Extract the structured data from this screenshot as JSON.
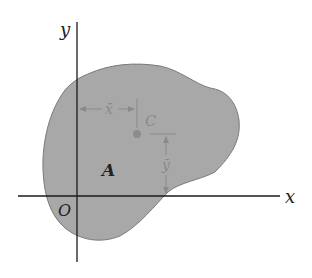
{
  "diagram": {
    "axes": {
      "x_label": "x",
      "y_label": "y",
      "origin_label": "O"
    },
    "region_label": "A",
    "centroid_label": "C",
    "dimensions": {
      "x_bar": "x̄",
      "y_bar": "ȳ"
    },
    "colors": {
      "fill": "#a7a7a7",
      "stroke": "#7a7a7a",
      "axis": "#1a1a1a",
      "dim": "#8a8a8a",
      "centroid": "#8c8c8c"
    }
  }
}
